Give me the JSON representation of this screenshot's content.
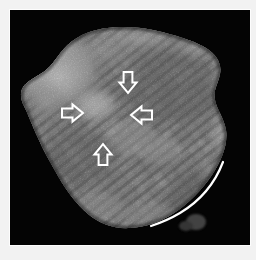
{
  "figure": {
    "name": "ultrasound-scan-figure",
    "modality_label": "grayscale sonogram",
    "background_color": "#ffffff",
    "canvas_color": "#030303",
    "annotation_color": "#ffffff"
  },
  "scan": {
    "description": "Grayscale ultrasound image of an ovoid soft-tissue mass on a black background, showing a bright hyperechoic region in the upper-left and a finely striated reticular texture running obliquely across the remainder of the mass.",
    "region_labels": {
      "hyperechoic_area": "bright upper-left focus",
      "striated_area": "oblique reticular striations",
      "background": "anechoic black field"
    },
    "gray_levels": {
      "background": "#040404",
      "darkest_tissue": "#3a3a3a",
      "mid_tissue": "#6e6e6e",
      "bright_tissue": "#b9b9b9",
      "brightest_focus": "#ececec"
    }
  },
  "annotations": {
    "color": "#ffffff",
    "arrows": [
      {
        "id": "arrow-1",
        "name": "arrow-down-marker",
        "direction": "down",
        "x": 107,
        "y": 62,
        "size": 22,
        "label": "downward open arrow"
      },
      {
        "id": "arrow-2",
        "name": "arrow-right-marker",
        "direction": "right",
        "x": 52,
        "y": 92,
        "size": 22,
        "label": "rightward open arrow"
      },
      {
        "id": "arrow-3",
        "name": "arrow-left-marker",
        "direction": "left",
        "x": 120,
        "y": 94,
        "size": 22,
        "label": "leftward open arrow"
      },
      {
        "id": "arrow-4",
        "name": "arrow-up-marker",
        "direction": "up",
        "x": 82,
        "y": 133,
        "size": 22,
        "label": "upward open arrow"
      }
    ],
    "marker_line": {
      "id": "boundary-trace",
      "name": "boundary-trace-line",
      "label": "white curvilinear boundary trace",
      "stroke_width": 2.2,
      "path": "M 213 152 C 205 173, 190 191, 170 203 C 160 209, 150 213, 141 216"
    }
  },
  "chart_data": {
    "type": "heatmap",
    "title": "",
    "xlabel": "",
    "ylabel": "",
    "legend": []
  }
}
